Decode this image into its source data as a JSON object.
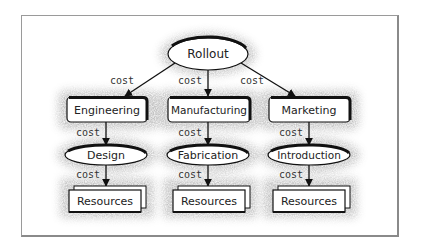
{
  "diagram": {
    "type": "hierarchy-tree",
    "root": {
      "label": "Rollout",
      "shape": "ellipse"
    },
    "edge_label": "cost",
    "columns": [
      {
        "level1": {
          "label": "Engineering",
          "shape": "rounded-rect"
        },
        "level2": {
          "label": "Design",
          "shape": "ellipse"
        },
        "level3": {
          "label": "Resources",
          "shape": "stacked-rect"
        }
      },
      {
        "level1": {
          "label": "Manufacturing",
          "shape": "rounded-rect"
        },
        "level2": {
          "label": "Fabrication",
          "shape": "ellipse"
        },
        "level3": {
          "label": "Resources",
          "shape": "stacked-rect"
        }
      },
      {
        "level1": {
          "label": "Marketing",
          "shape": "rounded-rect"
        },
        "level2": {
          "label": "Introduction",
          "shape": "ellipse"
        },
        "level3": {
          "label": "Resources",
          "shape": "stacked-rect"
        }
      }
    ],
    "edges": [
      {
        "from": "Rollout",
        "to": "Engineering",
        "label": "cost"
      },
      {
        "from": "Rollout",
        "to": "Manufacturing",
        "label": "cost"
      },
      {
        "from": "Rollout",
        "to": "Marketing",
        "label": "cost"
      },
      {
        "from": "Engineering",
        "to": "Design",
        "label": "cost"
      },
      {
        "from": "Manufacturing",
        "to": "Fabrication",
        "label": "cost"
      },
      {
        "from": "Marketing",
        "to": "Introduction",
        "label": "cost"
      },
      {
        "from": "Design",
        "to": "Resources",
        "label": "cost"
      },
      {
        "from": "Fabrication",
        "to": "Resources",
        "label": "cost"
      },
      {
        "from": "Introduction",
        "to": "Resources",
        "label": "cost"
      }
    ],
    "colors": {
      "stroke": "#111111",
      "halo": "#bdbdbd",
      "frame": "#9a9a9a"
    }
  }
}
